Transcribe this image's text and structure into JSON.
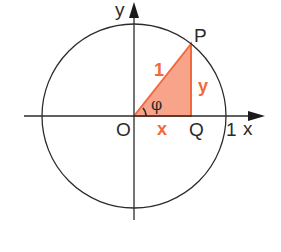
{
  "diagram": {
    "type": "unit-circle",
    "axes": {
      "x_label": "x",
      "y_label": "y"
    },
    "points": {
      "origin": "O",
      "point_on_circle": "P",
      "foot": "Q"
    },
    "labels": {
      "hypotenuse": "1",
      "opposite": "y",
      "adjacent": "x",
      "angle": "φ",
      "unit_mark": "1"
    },
    "colors": {
      "triangle_fill": "#f7a48a",
      "triangle_stroke": "#f26a3c",
      "accent_text": "#f26a3c",
      "line": "#2b2b2b"
    }
  }
}
